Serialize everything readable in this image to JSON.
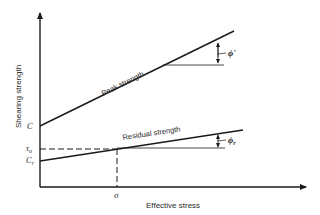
{
  "diagram": {
    "axes": {
      "y_label": "Shearing strength",
      "x_label": "Effective stress"
    },
    "lines": {
      "peak": {
        "label": "Peak strength",
        "angle_label": "ϕ'"
      },
      "residual": {
        "label": "Residual strength",
        "angle_label": "ϕ",
        "angle_subscript": "r"
      }
    },
    "y_markers": {
      "c": "C",
      "tau": "τ",
      "tau_subscript": "o",
      "cr": "C",
      "cr_subscript": "r"
    },
    "x_markers": {
      "sigma": "σ"
    },
    "colors": {
      "line": "#1a1a1a",
      "text": "#2a2a2a",
      "background": "#ffffff"
    }
  }
}
